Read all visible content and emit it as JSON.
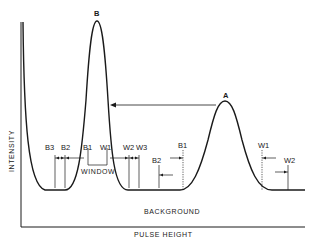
{
  "diagram": {
    "y_axis_label": "INTENSITY",
    "x_axis_label": "PULSE HEIGHT",
    "background_label": "BACKGROUND",
    "window_label": "WINDOW",
    "peak_labels": {
      "a": "A",
      "b": "B"
    },
    "left_markers": [
      "B3",
      "B2",
      "B1",
      "W1",
      "W2",
      "W3"
    ],
    "right_markers": {
      "b2": "B2",
      "b1": "B1",
      "w1": "W1",
      "w2": "W2"
    },
    "colors": {
      "line": "#1a1a1a",
      "background": "#ffffff"
    }
  }
}
